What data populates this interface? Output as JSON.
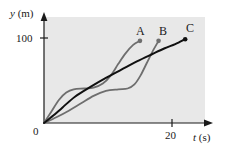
{
  "figure": {
    "background_color": "#ffffff",
    "plot_background_color": "#e8e8e8",
    "axis_color": "#1a1a1a"
  },
  "axes": {
    "y_label_symbol": "y",
    "y_label_unit": "(m)",
    "x_label_symbol": "t",
    "x_label_unit": "(s)",
    "origin_label": "0",
    "y_ticks": [
      {
        "label": "100",
        "value": 100
      }
    ],
    "x_ticks": [
      {
        "label": "20",
        "value": 20
      }
    ]
  },
  "chart_data": {
    "type": "line",
    "title": "",
    "xlabel": "t (s)",
    "ylabel": "y (m)",
    "xlim": [
      0,
      26
    ],
    "ylim": [
      0,
      129
    ],
    "grid": false,
    "legend": "inline-end-labels",
    "x_tick_values": [
      0,
      20
    ],
    "x_tick_labels": [
      "0",
      "20"
    ],
    "y_tick_values": [
      100
    ],
    "y_tick_labels": [
      "100"
    ],
    "series": [
      {
        "name": "A",
        "label": "A",
        "color": "#6e6e6e",
        "width": 1.8,
        "endpoint_marker": true,
        "endpoint": {
          "t": 15.5,
          "y": 100
        },
        "description": "rises quickly, plateaus near 40 m, then climbs steeply to 100 m",
        "points": [
          {
            "t": 0.0,
            "y": 0
          },
          {
            "t": 1.2,
            "y": 14
          },
          {
            "t": 2.4,
            "y": 28
          },
          {
            "t": 3.6,
            "y": 37
          },
          {
            "t": 4.8,
            "y": 41
          },
          {
            "t": 6.5,
            "y": 42
          },
          {
            "t": 8.0,
            "y": 43
          },
          {
            "t": 9.5,
            "y": 48
          },
          {
            "t": 10.8,
            "y": 58
          },
          {
            "t": 12.0,
            "y": 72
          },
          {
            "t": 13.2,
            "y": 85
          },
          {
            "t": 14.4,
            "y": 95
          },
          {
            "t": 15.5,
            "y": 100
          }
        ]
      },
      {
        "name": "B",
        "label": "B",
        "color": "#6e6e6e",
        "width": 1.8,
        "endpoint_marker": true,
        "endpoint": {
          "t": 18.5,
          "y": 100
        },
        "description": "slow start, long shallow plateau near 40 m, then steep rise to 100 m",
        "points": [
          {
            "t": 0.0,
            "y": 0
          },
          {
            "t": 2.0,
            "y": 7
          },
          {
            "t": 4.0,
            "y": 15
          },
          {
            "t": 6.0,
            "y": 24
          },
          {
            "t": 8.0,
            "y": 33
          },
          {
            "t": 10.0,
            "y": 39
          },
          {
            "t": 12.0,
            "y": 41
          },
          {
            "t": 13.5,
            "y": 42
          },
          {
            "t": 14.6,
            "y": 47
          },
          {
            "t": 15.6,
            "y": 58
          },
          {
            "t": 16.6,
            "y": 73
          },
          {
            "t": 17.6,
            "y": 88
          },
          {
            "t": 18.5,
            "y": 100
          }
        ]
      },
      {
        "name": "C",
        "label": "C",
        "color": "#111111",
        "width": 2.0,
        "endpoint_marker": true,
        "endpoint": {
          "t": 22.8,
          "y": 102
        },
        "description": "smooth steadily increasing curve, nearly linear in the middle",
        "points": [
          {
            "t": 0.0,
            "y": 0
          },
          {
            "t": 1.5,
            "y": 9
          },
          {
            "t": 3.0,
            "y": 19
          },
          {
            "t": 5.0,
            "y": 32
          },
          {
            "t": 7.5,
            "y": 44
          },
          {
            "t": 10.0,
            "y": 55
          },
          {
            "t": 12.5,
            "y": 65
          },
          {
            "t": 15.0,
            "y": 75
          },
          {
            "t": 17.5,
            "y": 84
          },
          {
            "t": 19.5,
            "y": 91
          },
          {
            "t": 21.2,
            "y": 96
          },
          {
            "t": 22.8,
            "y": 102
          }
        ]
      }
    ]
  }
}
